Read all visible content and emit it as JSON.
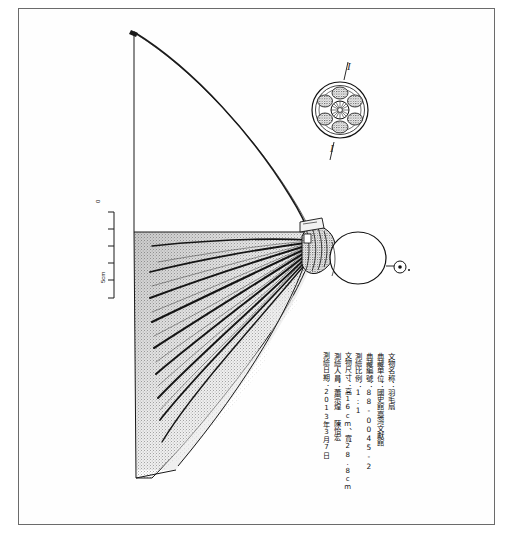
{
  "plate": {
    "title": "artifact measured drawing plate",
    "frame_color": "#6b6b6b",
    "ink_color": "#1a1a1a",
    "paper_color": "#ffffff"
  },
  "scale_bar": {
    "top_label": "0",
    "bottom_label": "5cm",
    "divisions": 5,
    "orientation": "vertical"
  },
  "section_marks": {
    "top": "I",
    "bottom": "I"
  },
  "record": {
    "columns": [
      {
        "key": "name",
        "text": "文物名称：羽毛扇"
      },
      {
        "key": "institute",
        "text": "典藏单位：國史館臺灣文獻館"
      },
      {
        "key": "number",
        "text": "典藏編號：88-0045-2"
      },
      {
        "key": "scale",
        "text": "測繪比例：1:1"
      },
      {
        "key": "size",
        "text": "文物尺寸：高16cm、寬28.8cm"
      },
      {
        "key": "drafter",
        "text": "測繪人員：蕭宗煌 陳怡宏"
      },
      {
        "key": "date",
        "text": "測繪日期：2013年3月7日"
      }
    ]
  },
  "figure": {
    "object_name": "feather fan",
    "parts": [
      "long curved shaft",
      "hatched feather vane",
      "radiating quill ribs",
      "decorated ferrule hub",
      "round handle knob",
      "small terminal bead"
    ],
    "detail_inset": "circular rosette medallion (ferrule end cap)"
  }
}
